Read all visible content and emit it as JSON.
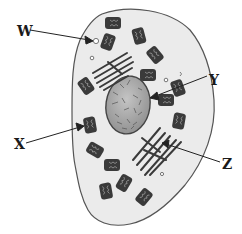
{
  "diagram": {
    "type": "animal cell diagram",
    "colors": {
      "cytoplasm": "#ebebeb",
      "membrane": "#555555",
      "nucleus": "#a8a8a8",
      "organelle_dark": "#3a3a3a",
      "text": "#1a1a1a"
    },
    "labels": [
      {
        "id": "W",
        "text": "W",
        "points_to": "small vesicle (white circle)"
      },
      {
        "id": "X",
        "text": "X",
        "points_to": "mitochondrion"
      },
      {
        "id": "Y",
        "text": "Y",
        "points_to": "nucleus"
      },
      {
        "id": "Z",
        "text": "Z",
        "points_to": "endoplasmic reticulum / golgi stack"
      }
    ]
  }
}
